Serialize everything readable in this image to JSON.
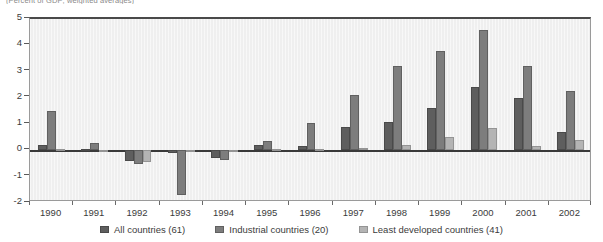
{
  "caption": "(Percent of GDP; weighted averages)",
  "chart_data": {
    "type": "bar",
    "title": "",
    "subtitle": "",
    "xlabel": "",
    "ylabel": "",
    "ylim": [
      -2,
      5
    ],
    "yticks": [
      5,
      4,
      3,
      2,
      1,
      0,
      -1,
      -2
    ],
    "grid": false,
    "legend_position": "bottom",
    "categories": [
      "1990",
      "1991",
      "1992",
      "1993",
      "1994",
      "1995",
      "1996",
      "1997",
      "1998",
      "1999",
      "2000",
      "2001",
      "2002"
    ],
    "series": [
      {
        "name": "All countries (61)",
        "color": "#5e5e5e",
        "values": [
          0.2,
          0.05,
          -0.4,
          -0.1,
          -0.3,
          0.2,
          0.15,
          0.9,
          1.1,
          1.6,
          2.4,
          2.0,
          0.7
        ]
      },
      {
        "name": "Industrial countries (20)",
        "color": "#7d7d7d",
        "values": [
          1.5,
          0.3,
          -0.5,
          -1.7,
          -0.35,
          0.35,
          1.05,
          2.1,
          3.2,
          3.8,
          4.6,
          3.2,
          2.25
        ]
      },
      {
        "name": "Least developed countries (41)",
        "color": "#b4b4b4",
        "values": [
          0.05,
          0.02,
          -0.45,
          0.0,
          0.0,
          0.05,
          0.04,
          0.1,
          0.22,
          0.5,
          0.85,
          0.15,
          0.4
        ]
      }
    ]
  },
  "legend": [
    {
      "label": "All countries (61)",
      "color": "#5e5e5e"
    },
    {
      "label": "Industrial countries (20)",
      "color": "#7d7d7d"
    },
    {
      "label": "Least developed countries (41)",
      "color": "#b4b4b4"
    }
  ]
}
